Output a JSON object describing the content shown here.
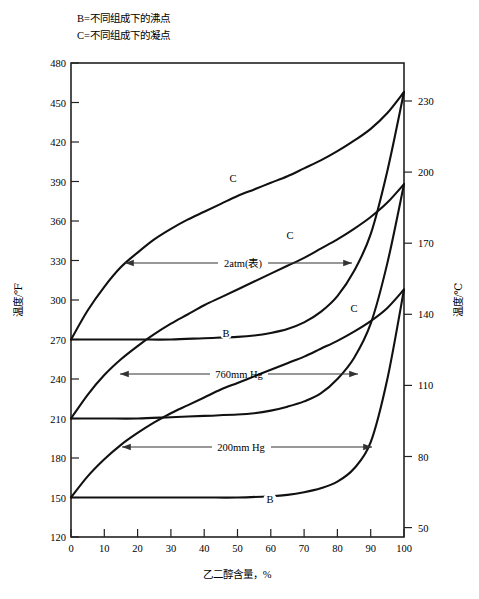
{
  "legend": {
    "lines": [
      "B=不同组成下的沸点",
      "C=不同组成下的凝点"
    ]
  },
  "axes": {
    "left_title": "温度/℉",
    "right_title": "温度/℃",
    "x_title": "乙二醇含量，%",
    "left_ticks": [
      "480",
      "450",
      "420",
      "390",
      "360",
      "330",
      "300",
      "270",
      "240",
      "210",
      "180",
      "150",
      "120"
    ],
    "right_ticks": [
      "230",
      "200",
      "170",
      "140",
      "110",
      "80",
      "50"
    ],
    "x_ticks": [
      "0",
      "10",
      "20",
      "30",
      "40",
      "50",
      "60",
      "70",
      "80",
      "90",
      "100"
    ]
  },
  "annotations": [
    {
      "name": "2atm",
      "label": "2atm(表)"
    },
    {
      "name": "760mmhg",
      "label": "760mm Hg"
    },
    {
      "name": "200mmhg",
      "label": "200mm Hg"
    }
  ],
  "curve_labels": {
    "c_2atm": "C",
    "c_760": "C",
    "c_200": "C",
    "b_2atm": "B",
    "b_200": "B"
  },
  "colors": {
    "ink": "#111111",
    "frame": "#222222",
    "annotation": "#333333"
  },
  "chart_data": {
    "type": "line",
    "title": "",
    "xlabel": "乙二醇含量，%",
    "ylabel": "温度/℉",
    "ylabel_secondary": "温度/℃",
    "xlim": [
      0,
      100
    ],
    "ylim": [
      120,
      480
    ],
    "ylim_secondary": [
      40.5,
      248.9
    ],
    "grid": false,
    "legend": [
      "B=不同组成下的沸点",
      "C=不同组成下的凝点"
    ],
    "annotations": [
      "2atm(表)",
      "760mm Hg",
      "200mm Hg"
    ],
    "series": [
      {
        "name": "C-2atm",
        "pressure": "2atm(表)",
        "kind": "dew-point",
        "x": [
          0,
          5,
          10,
          15,
          20,
          25,
          30,
          35,
          40,
          45,
          50,
          55,
          60,
          65,
          70,
          75,
          80,
          85,
          90,
          95,
          100
        ],
        "values": [
          270,
          292,
          310,
          325,
          336,
          346,
          354,
          361,
          367,
          373,
          379,
          384,
          389,
          394,
          400,
          406,
          413,
          421,
          430,
          442,
          458
        ]
      },
      {
        "name": "B-2atm",
        "pressure": "2atm(表)",
        "kind": "boiling-point",
        "x": [
          0,
          10,
          20,
          30,
          40,
          50,
          55,
          60,
          65,
          70,
          75,
          80,
          85,
          90,
          95,
          100
        ],
        "values": [
          270,
          270,
          270,
          270,
          271,
          272,
          273,
          275,
          278,
          283,
          291,
          303,
          322,
          350,
          398,
          458
        ]
      },
      {
        "name": "C-760mmHg",
        "pressure": "760mm Hg",
        "kind": "dew-point",
        "x": [
          0,
          5,
          10,
          15,
          20,
          25,
          30,
          35,
          40,
          45,
          50,
          55,
          60,
          65,
          70,
          75,
          80,
          85,
          90,
          95,
          100
        ],
        "values": [
          210,
          228,
          243,
          255,
          265,
          274,
          282,
          289,
          296,
          302,
          308,
          314,
          320,
          326,
          332,
          339,
          346,
          354,
          363,
          374,
          388
        ]
      },
      {
        "name": "B-760mmHg",
        "pressure": "760mm Hg",
        "kind": "boiling-point",
        "x": [
          0,
          10,
          20,
          30,
          40,
          50,
          55,
          60,
          65,
          70,
          75,
          80,
          85,
          90,
          95,
          100
        ],
        "values": [
          210,
          210,
          210,
          211,
          212,
          213,
          214,
          216,
          219,
          223,
          229,
          240,
          256,
          282,
          328,
          388
        ]
      },
      {
        "name": "C-200mmHg",
        "pressure": "200mm Hg",
        "kind": "dew-point",
        "x": [
          0,
          5,
          10,
          15,
          20,
          25,
          30,
          35,
          40,
          45,
          50,
          55,
          60,
          65,
          70,
          75,
          80,
          85,
          90,
          95,
          100
        ],
        "values": [
          150,
          166,
          179,
          190,
          199,
          207,
          214,
          220,
          226,
          232,
          237,
          242,
          247,
          252,
          257,
          263,
          269,
          276,
          284,
          294,
          308
        ]
      },
      {
        "name": "B-200mmHg",
        "pressure": "200mm Hg",
        "kind": "boiling-point",
        "x": [
          0,
          10,
          20,
          30,
          40,
          50,
          60,
          65,
          70,
          75,
          80,
          85,
          90,
          95,
          100
        ],
        "values": [
          150,
          150,
          150,
          150,
          150,
          150,
          151,
          152,
          154,
          157,
          162,
          172,
          192,
          240,
          308
        ]
      }
    ]
  }
}
